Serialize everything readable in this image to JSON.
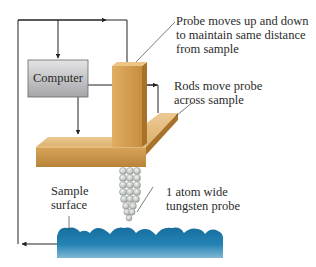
{
  "diagram": {
    "components": {
      "computer": {
        "label": "Computer",
        "fill_top": "#e2e2e4",
        "fill_bottom": "#a9a9ad",
        "stroke": "#555555"
      },
      "post": {
        "color_front": "#d9a55a",
        "color_side": "#a8722b"
      },
      "platform": {
        "color_top": "#e9c58a",
        "color_front": "#c99446",
        "color_edge": "#a8722b"
      },
      "probe": {
        "color": "#c8ccc8",
        "stroke": "#8a8f8a"
      },
      "sample": {
        "color_top": "#1e7fae",
        "color_bottom": "#3e8fb8"
      },
      "lines": {
        "color": "#222222"
      }
    },
    "annotations": [
      {
        "id": "probe-moves",
        "lines": [
          "Probe moves up and down",
          "to maintain same distance",
          "from sample"
        ]
      },
      {
        "id": "rods-move",
        "lines": [
          "Rods move probe",
          "across sample"
        ]
      },
      {
        "id": "sample-surface",
        "lines": [
          "Sample",
          "surface"
        ]
      },
      {
        "id": "tungsten-probe",
        "lines": [
          "1 atom wide",
          "tungsten probe"
        ]
      }
    ]
  }
}
